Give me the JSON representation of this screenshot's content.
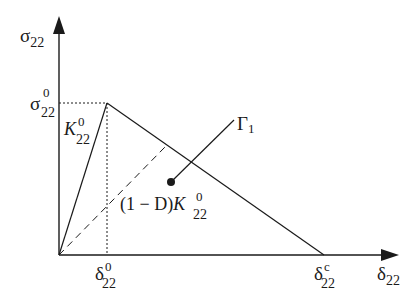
{
  "diagram": {
    "type": "bilinear traction-separation law",
    "colors": {
      "stroke": "#1a1a1a",
      "background": "#ffffff"
    },
    "axes": {
      "y": {
        "symbol": "σ",
        "subscript": "22"
      },
      "x": {
        "symbol": "δ",
        "subscript": "22"
      }
    },
    "labels": {
      "peak_stress": {
        "symbol": "σ",
        "superscript": "0",
        "subscript": "22"
      },
      "onset_disp": {
        "symbol": "δ",
        "superscript": "0",
        "subscript": "22"
      },
      "final_disp": {
        "symbol": "δ",
        "superscript": "c",
        "subscript": "22"
      },
      "initial_stiffness": {
        "symbol": "K",
        "superscript": "0",
        "subscript": "22"
      },
      "degraded_stiffness": {
        "prefix": "(1 − D)",
        "symbol": "K",
        "superscript": "0",
        "subscript": "22"
      },
      "energy": {
        "symbol": "Γ",
        "subscript": "1"
      }
    }
  }
}
